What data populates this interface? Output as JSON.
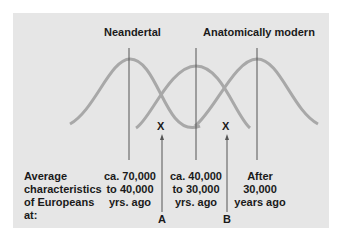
{
  "title_left": "Neandertal",
  "title_right": "Anatomically modern",
  "caption": [
    "Average",
    "characteristics",
    "of Europeans",
    "at:"
  ],
  "periods": [
    {
      "lines": [
        "ca. 70,000",
        "to 40,000",
        "yrs. ago"
      ]
    },
    {
      "lines": [
        "ca. 40,000",
        "to 30,000",
        "yrs. ago"
      ]
    },
    {
      "lines": [
        "After",
        "30,000",
        "years ago"
      ]
    }
  ],
  "markers": [
    {
      "mark": "X",
      "label": "A"
    },
    {
      "mark": "X",
      "label": "B"
    }
  ],
  "colors": {
    "panel": "#e6e6e6",
    "curve": "#a8a8a8",
    "line": "#555555",
    "text": "#1a1a1a"
  }
}
